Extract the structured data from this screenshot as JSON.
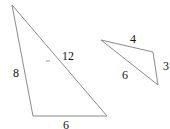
{
  "diagram": {
    "type": "triangles",
    "stroke_color": "#8a8a8a",
    "triangles": [
      {
        "name": "large-triangle",
        "points": [
          [
            12,
            5
          ],
          [
            33,
            116
          ],
          [
            107,
            116
          ]
        ],
        "side_labels": {
          "left": "8",
          "hypotenuse": "12",
          "bottom": "6"
        }
      },
      {
        "name": "small-triangle",
        "points": [
          [
            101,
            40
          ],
          [
            153,
            52
          ],
          [
            158,
            85
          ]
        ],
        "side_labels": {
          "top": "4",
          "right": "3",
          "long": "6"
        }
      }
    ]
  }
}
